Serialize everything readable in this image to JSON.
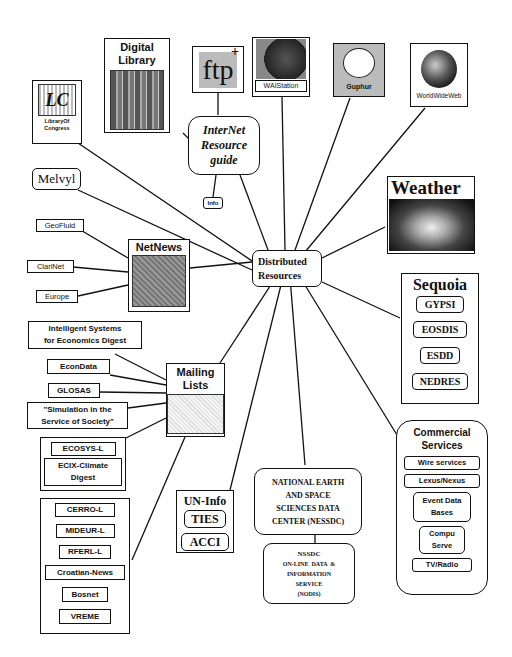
{
  "hub": {
    "label_line1": "Distributed",
    "label_line2": "Resources"
  },
  "internet_guide": {
    "line1": "InterNet",
    "line2": "Resource",
    "line3": "guide",
    "info_label": "Info"
  },
  "top_icons": {
    "library_of_congress": {
      "logo": "LC",
      "label_line1": "LibraryOf",
      "label_line2": "Congress"
    },
    "digital_library": {
      "title_line1": "Digital",
      "title_line2": "Library"
    },
    "ftp": {
      "label": "ftp",
      "superscript": "+"
    },
    "waistation": {
      "label": "WAIStation"
    },
    "gopher": {
      "label": "Guphur"
    },
    "www": {
      "label": "WorldWideWeb"
    }
  },
  "melvyl": {
    "label": "Melvyl"
  },
  "weather": {
    "title": "Weather"
  },
  "netnews": {
    "title": "NetNews",
    "children": [
      "GeoFluid",
      "ClariNet",
      "Europe"
    ]
  },
  "sequoia": {
    "title": "Sequoia",
    "items": [
      "GYPSI",
      "EOSDIS",
      "ESDD",
      "NEDRES"
    ]
  },
  "mailing_lists": {
    "title_line1": "Mailing",
    "title_line2": "Lists",
    "children": [
      {
        "line1": "Intelligent Systems",
        "line2": "for Economics Digest"
      },
      {
        "line1": "EconData"
      },
      {
        "line1": "GLOSAS"
      },
      {
        "line1": "\"Simulation in the",
        "line2": "Service of Society\""
      }
    ],
    "group_a": [
      {
        "line1": "ECOSYS-L"
      },
      {
        "line1": "ECIX-Climate",
        "line2": "Digest"
      }
    ],
    "group_b": [
      "CERRO-L",
      "MIDEUR-L",
      "RFERL-L",
      "Croatian-News",
      "Bosnet",
      "VREME"
    ]
  },
  "un_info": {
    "title": "UN-Info",
    "items": [
      "TIES",
      "ACCI"
    ]
  },
  "nessdc": {
    "lines": [
      "NATIONAL EARTH",
      "AND SPACE",
      "SCIENCES DATA",
      "CENTER (NESSDC)"
    ],
    "nodis_lines": [
      "NSSDC",
      "ON-LINE  DATA  &",
      "INFORMATION",
      "SERVICE",
      "(NODIS)"
    ]
  },
  "commercial": {
    "title_line1": "Commercial",
    "title_line2": "Services",
    "items": [
      {
        "line1": "Wire services"
      },
      {
        "line1": "Lexus/Nexus"
      },
      {
        "line1": "Event Data",
        "line2": "Bases"
      },
      {
        "line1": "Compu",
        "line2": "Serve"
      },
      {
        "line1": "TV/Radio"
      }
    ]
  },
  "colors": {
    "ink": "#111111",
    "background": "#ffffff",
    "image_gray": "#888888"
  }
}
